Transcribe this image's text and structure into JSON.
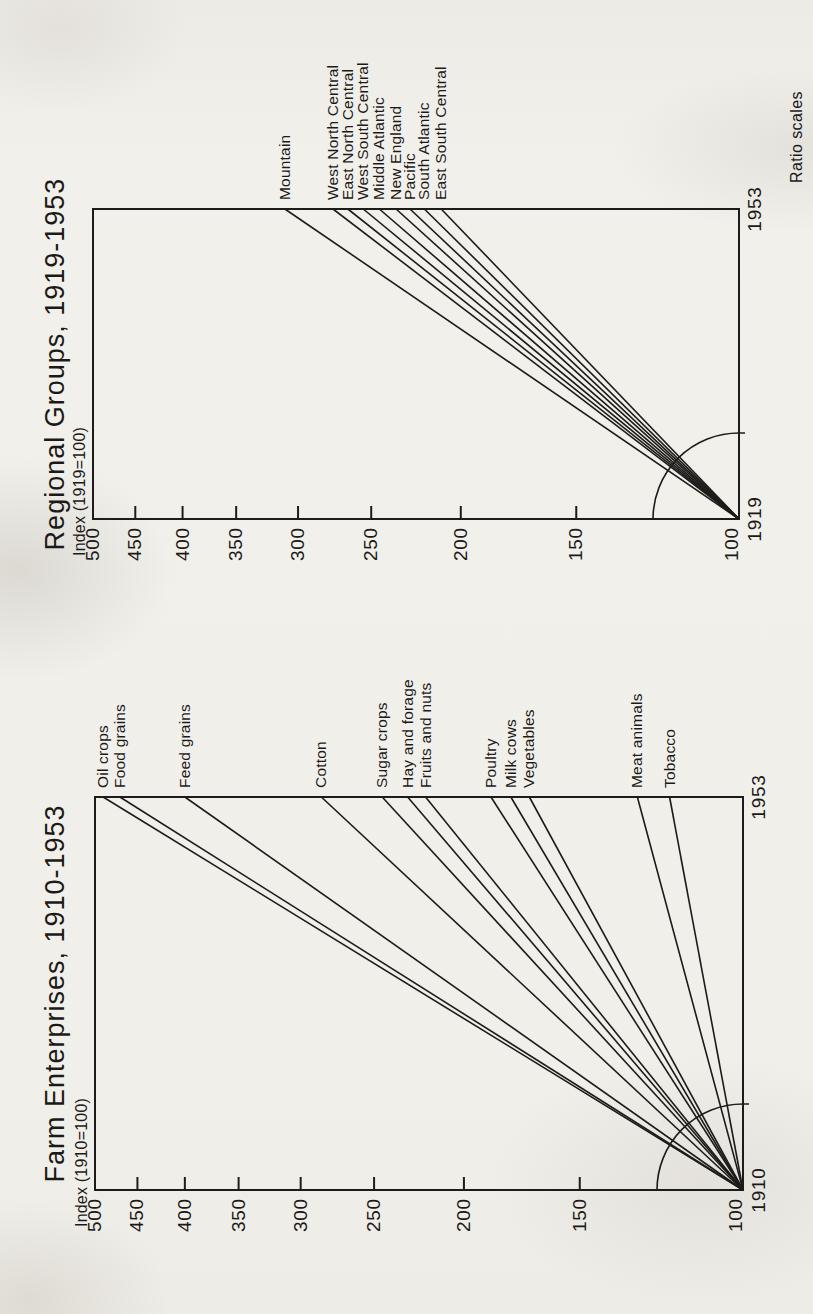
{
  "page": {
    "note": "Ratio scales",
    "ink_color": "#1d1c1a",
    "paper_color": "#f1efea"
  },
  "chart_data": [
    {
      "type": "line",
      "title": "Farm Enterprises, 1910-1953",
      "index_label": "Index (1910=100)",
      "scale": "ratio-log",
      "legend_position": "right-of-plot",
      "grid": false,
      "x_range": [
        1910,
        1953
      ],
      "x_tick_labels": [
        "1910",
        "1953"
      ],
      "ylim": [
        100,
        500
      ],
      "y_ticks": [
        100,
        150,
        200,
        250,
        300,
        350,
        400,
        450,
        500
      ],
      "origin": {
        "year": 1910,
        "index": 100
      },
      "series": [
        {
          "name": "Oil crops",
          "x": [
            1910,
            1953
          ],
          "values": [
            100,
            490
          ]
        },
        {
          "name": "Food grains",
          "x": [
            1910,
            1953
          ],
          "values": [
            100,
            470
          ]
        },
        {
          "name": "Feed grains",
          "x": [
            1910,
            1953
          ],
          "values": [
            100,
            400
          ]
        },
        {
          "name": "Cotton",
          "x": [
            1910,
            1953
          ],
          "values": [
            100,
            285
          ]
        },
        {
          "name": "Sugar crops",
          "x": [
            1910,
            1953
          ],
          "values": [
            100,
            245
          ]
        },
        {
          "name": "Hay and forage",
          "x": [
            1910,
            1953
          ],
          "values": [
            100,
            230
          ]
        },
        {
          "name": "Fruits and nuts",
          "x": [
            1910,
            1953
          ],
          "values": [
            100,
            220
          ]
        },
        {
          "name": "Poultry",
          "x": [
            1910,
            1953
          ],
          "values": [
            100,
            187
          ]
        },
        {
          "name": "Milk cows",
          "x": [
            1910,
            1953
          ],
          "values": [
            100,
            178
          ]
        },
        {
          "name": "Vegetables",
          "x": [
            1910,
            1953
          ],
          "values": [
            100,
            170
          ]
        },
        {
          "name": "Meat animals",
          "x": [
            1910,
            1953
          ],
          "values": [
            100,
            130
          ]
        },
        {
          "name": "Tobacco",
          "x": [
            1910,
            1953
          ],
          "values": [
            100,
            120
          ]
        }
      ]
    },
    {
      "type": "line",
      "title": "Regional Groups, 1919-1953",
      "index_label": "Index (1919=100)",
      "scale": "ratio-log",
      "legend_position": "right-of-plot",
      "grid": false,
      "x_range": [
        1919,
        1953
      ],
      "x_tick_labels": [
        "1919",
        "1953"
      ],
      "ylim": [
        100,
        500
      ],
      "y_ticks": [
        100,
        150,
        200,
        250,
        300,
        350,
        400,
        450,
        500
      ],
      "origin": {
        "year": 1919,
        "index": 100
      },
      "series": [
        {
          "name": "Mountain",
          "x": [
            1919,
            1953
          ],
          "values": [
            100,
            310
          ]
        },
        {
          "name": "West North Central",
          "x": [
            1919,
            1953
          ],
          "values": [
            100,
            275
          ]
        },
        {
          "name": "East North Central",
          "x": [
            1919,
            1953
          ],
          "values": [
            100,
            265
          ]
        },
        {
          "name": "West South Central",
          "x": [
            1919,
            1953
          ],
          "values": [
            100,
            255
          ]
        },
        {
          "name": "Middle Atlantic",
          "x": [
            1919,
            1953
          ],
          "values": [
            100,
            245
          ]
        },
        {
          "name": "New England",
          "x": [
            1919,
            1953
          ],
          "values": [
            100,
            235
          ]
        },
        {
          "name": "Pacific",
          "x": [
            1919,
            1953
          ],
          "values": [
            100,
            227
          ]
        },
        {
          "name": "South Atlantic",
          "x": [
            1919,
            1953
          ],
          "values": [
            100,
            219
          ]
        },
        {
          "name": "East South Central",
          "x": [
            1919,
            1953
          ],
          "values": [
            100,
            210
          ]
        }
      ]
    }
  ]
}
